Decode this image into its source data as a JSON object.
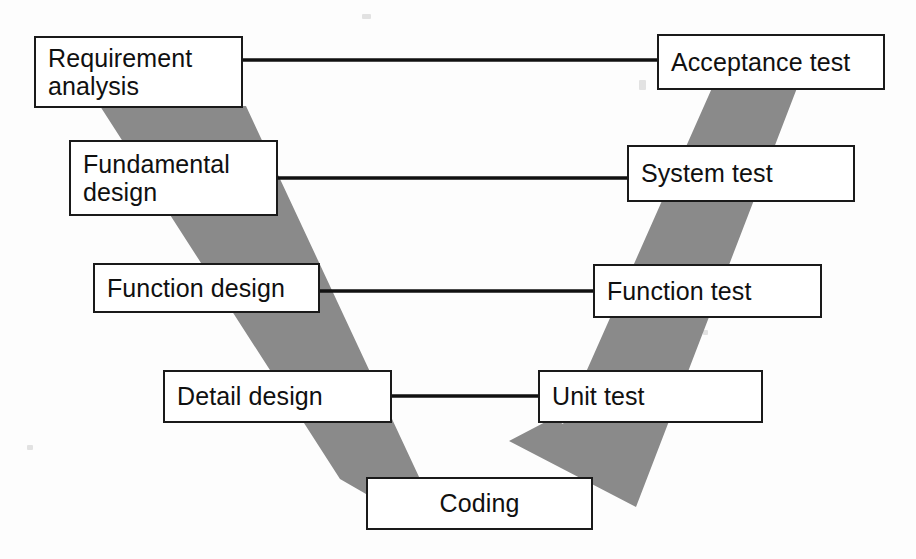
{
  "diagram": {
    "type": "v-model",
    "canvas": {
      "width": 916,
      "height": 559
    },
    "colors": {
      "band_gray": "#8a8a8a",
      "box_border": "#1a1a1a",
      "box_fill": "#ffffff",
      "text": "#101010",
      "arrow": "#111111",
      "background": "#fdfdfd"
    }
  },
  "left_branch": {
    "name": "development-phases",
    "nodes": [
      {
        "id": "requirement-analysis",
        "label": "Requirement\nanalysis",
        "x": 34,
        "y": 36,
        "w": 209,
        "h": 72,
        "align": "left"
      },
      {
        "id": "fundamental-design",
        "label": "Fundamental\ndesign",
        "x": 69,
        "y": 140,
        "w": 209,
        "h": 76,
        "align": "left"
      },
      {
        "id": "function-design",
        "label": "Function design",
        "x": 93,
        "y": 263,
        "w": 227,
        "h": 50,
        "align": "left"
      },
      {
        "id": "detail-design",
        "label": "Detail design",
        "x": 163,
        "y": 370,
        "w": 229,
        "h": 53,
        "align": "left"
      }
    ]
  },
  "right_branch": {
    "name": "testing-phases",
    "nodes": [
      {
        "id": "acceptance-test",
        "label": "Acceptance test",
        "x": 657,
        "y": 34,
        "w": 228,
        "h": 56,
        "align": "left"
      },
      {
        "id": "system-test",
        "label": "System test",
        "x": 627,
        "y": 145,
        "w": 228,
        "h": 57,
        "align": "left"
      },
      {
        "id": "function-test",
        "label": "Function test",
        "x": 593,
        "y": 264,
        "w": 229,
        "h": 54,
        "align": "left"
      },
      {
        "id": "unit-test",
        "label": "Unit test",
        "x": 538,
        "y": 370,
        "w": 225,
        "h": 53,
        "align": "left"
      }
    ]
  },
  "bottom": {
    "node": {
      "id": "coding",
      "label": "Coding",
      "x": 366,
      "y": 477,
      "w": 227,
      "h": 53,
      "align": "center"
    }
  },
  "connectors": [
    {
      "id": "requirement-analysis--acceptance-test",
      "from": "requirement-analysis",
      "to": "acceptance-test",
      "x1": 243,
      "x2": 657,
      "y": 60,
      "style": "double-headed"
    },
    {
      "id": "fundamental-design--system-test",
      "from": "fundamental-design",
      "to": "system-test",
      "x1": 278,
      "x2": 627,
      "y": 178,
      "style": "double-headed"
    },
    {
      "id": "function-design--function-test",
      "from": "function-design",
      "to": "function-test",
      "x1": 320,
      "x2": 593,
      "y": 291,
      "style": "double-headed"
    },
    {
      "id": "detail-design--unit-test",
      "from": "detail-design",
      "to": "unit-test",
      "x1": 392,
      "x2": 538,
      "y": 396,
      "style": "double-headed"
    }
  ],
  "bands": {
    "left_band_points": "100,106 246,106 418,478 366,478",
    "right_band_points": "716,88 795,88 636,506 512,440",
    "description": "Two gray diagonal stripes forming the V shape behind the boxes"
  }
}
